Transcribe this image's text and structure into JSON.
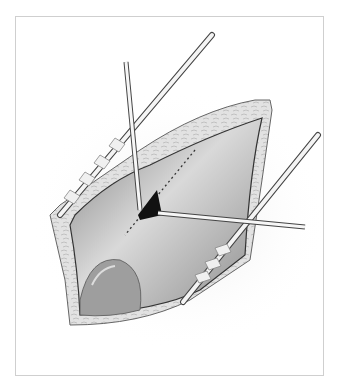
{
  "figure": {
    "type": "medical-illustration",
    "colors": {
      "frame_border": "#cfcfcf",
      "skin": "#e4e4e4",
      "cavity": "#9a9a9a",
      "opening": "#111111",
      "instrument": "#f2f2f2"
    }
  }
}
